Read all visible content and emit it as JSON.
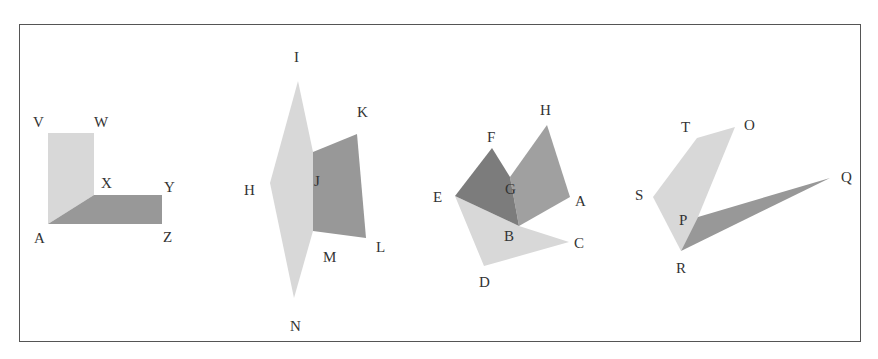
{
  "figure": {
    "colors": {
      "light": "#d8d8d8",
      "medium": "#a0a0a0",
      "dark": "#989898",
      "darkest": "#7c7c7c",
      "label": "#333333",
      "border": "#555555"
    },
    "figures": [
      {
        "name": "figure-vwxyz",
        "labels": [
          "V",
          "W",
          "X",
          "Y",
          "A",
          "Z"
        ]
      },
      {
        "name": "figure-hijklmn",
        "labels": [
          "I",
          "K",
          "H",
          "J",
          "L",
          "M",
          "N"
        ]
      },
      {
        "name": "figure-abcdefgh",
        "labels": [
          "F",
          "H",
          "E",
          "G",
          "A",
          "B",
          "C",
          "D"
        ]
      },
      {
        "name": "figure-opqrst",
        "labels": [
          "T",
          "O",
          "S",
          "P",
          "Q",
          "R"
        ]
      }
    ]
  }
}
